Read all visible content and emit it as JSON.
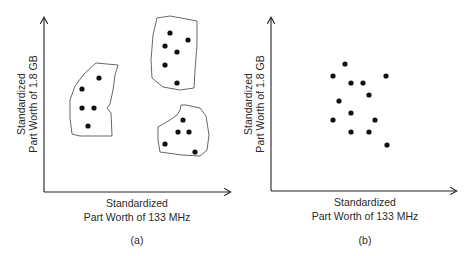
{
  "panels": [
    {
      "id": "a",
      "caption": "(a)",
      "x_label_line1": "Standardized",
      "x_label_line2": "Part Worth of 133 MHz",
      "y_label_line1": "Standardized",
      "y_label_line2": "Part Worth of 1.8 GB",
      "clusters": [
        {
          "name": "left-cluster",
          "points": [
            [
              99,
              78
            ],
            [
              82,
              89
            ],
            [
              82,
              108
            ],
            [
              94,
              108
            ],
            [
              88,
              126
            ]
          ]
        },
        {
          "name": "top-right-cluster",
          "points": [
            [
              170,
              33
            ],
            [
              188,
              40
            ],
            [
              165,
              46
            ],
            [
              177,
              52
            ],
            [
              165,
              65
            ],
            [
              177,
              83
            ]
          ]
        },
        {
          "name": "bottom-right-cluster",
          "points": [
            [
              183,
              120
            ],
            [
              178,
              132
            ],
            [
              189,
              132
            ],
            [
              165,
              144
            ],
            [
              195,
              152
            ]
          ]
        }
      ]
    },
    {
      "id": "b",
      "caption": "(b)",
      "x_label_line1": "Standardized",
      "x_label_line2": "Part Worth of 133 MHz",
      "y_label_line1": "Standardized",
      "y_label_line2": "Part Worth of 1.8 GB",
      "points": [
        [
          345,
          64
        ],
        [
          333,
          76
        ],
        [
          386,
          76
        ],
        [
          351,
          83
        ],
        [
          363,
          83
        ],
        [
          369,
          95
        ],
        [
          339,
          101
        ],
        [
          351,
          113
        ],
        [
          333,
          120
        ],
        [
          375,
          120
        ],
        [
          351,
          132
        ],
        [
          369,
          132
        ],
        [
          387,
          145
        ]
      ]
    }
  ],
  "colors": {
    "axis": "#222222",
    "dot": "#111111",
    "outline": "#444444",
    "text": "#2a2a2a"
  }
}
